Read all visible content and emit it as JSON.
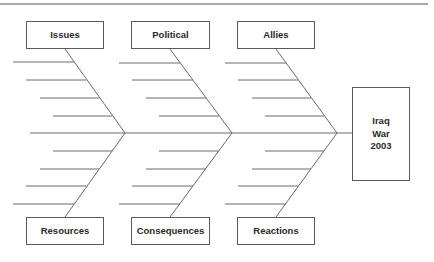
{
  "diagram": {
    "type": "fishbone",
    "line_color": "#6a6a6a",
    "text_color": "#2a2a2a",
    "effect": {
      "lines": [
        "Iraq",
        "War",
        "2003"
      ]
    },
    "categories": {
      "top": [
        {
          "label": "Issues"
        },
        {
          "label": "Political"
        },
        {
          "label": "Allies"
        }
      ],
      "bottom": [
        {
          "label": "Resources"
        },
        {
          "label": "Consequences"
        },
        {
          "label": "Reactions"
        }
      ]
    },
    "ribs_per_bone": 4
  }
}
